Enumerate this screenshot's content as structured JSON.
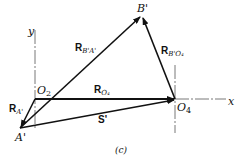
{
  "figure": {
    "caption": "(c)",
    "axes": {
      "x_label": "x",
      "y_label": "y"
    },
    "points": {
      "A": "A'",
      "B": "B'",
      "O2": "O",
      "O2_sub": "2",
      "O4": "O",
      "O4_sub": "4"
    },
    "vectors": {
      "R_A": {
        "main": "R",
        "sub": "A'"
      },
      "R_BA": {
        "main": "R",
        "sub": "B'A'"
      },
      "R_BO4": {
        "main": "R",
        "sub": "B'O₄"
      },
      "R_O4": {
        "main": "R",
        "sub": "O₄"
      },
      "S": {
        "main": "S'"
      }
    },
    "colors": {
      "line": "#111111",
      "axis": "#555555",
      "background": "#ffffff"
    }
  }
}
